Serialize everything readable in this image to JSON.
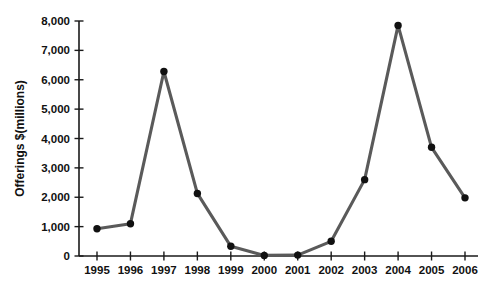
{
  "chart_data": {
    "type": "line",
    "title": "",
    "xlabel": "",
    "ylabel": "Offerings $(millions)",
    "categories": [
      "1995",
      "1996",
      "1997",
      "1998",
      "1999",
      "2000",
      "2001",
      "2002",
      "2003",
      "2004",
      "2005",
      "2006"
    ],
    "values": [
      930,
      1100,
      6280,
      2130,
      330,
      20,
      30,
      500,
      2600,
      7850,
      3700,
      1980
    ],
    "series": [
      {
        "name": "Offerings",
        "values": [
          930,
          1100,
          6280,
          2130,
          330,
          20,
          30,
          500,
          2600,
          7850,
          3700,
          1980
        ]
      }
    ],
    "ylim": [
      0,
      8000
    ],
    "ytick_values": [
      0,
      1000,
      2000,
      3000,
      4000,
      5000,
      6000,
      7000,
      8000
    ],
    "ytick_labels": [
      "0",
      "1,000",
      "2,000",
      "3,000",
      "4,000",
      "5,000",
      "6,000",
      "7,000",
      "8,000"
    ],
    "xtick_labels": [
      "1995",
      "1996",
      "1997",
      "1998",
      "1999",
      "2000",
      "2001",
      "2002",
      "2003",
      "2004",
      "2005",
      "2006"
    ],
    "grid": false,
    "legend": false,
    "legend_position": "none",
    "marker": "filled-circle",
    "line_color": "#5a5a5a",
    "marker_color": "#111111",
    "axis_color": "#1a1a1a",
    "background_color": "#ffffff"
  }
}
